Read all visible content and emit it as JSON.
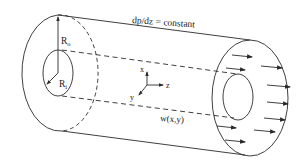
{
  "diagram": {
    "title_label": "dp/dz = constant",
    "outer_radius_label": "R",
    "outer_radius_sub": "o",
    "inner_radius_label": "R",
    "inner_radius_sub": "i",
    "axis_x": "x",
    "axis_y": "y",
    "axis_z": "z",
    "velocity_label": "w(x,y)",
    "stroke_color": "#2a2a2a",
    "background": "#ffffff"
  }
}
